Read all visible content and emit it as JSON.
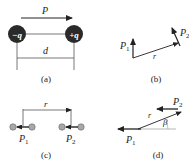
{
  "figure": {
    "panels": [
      {
        "id": "a",
        "caption": "(a)",
        "labels": {
          "moment": "P",
          "distance": "d",
          "neg_charge": "−q",
          "pos_charge": "+q"
        }
      },
      {
        "id": "b",
        "caption": "(b)",
        "labels": {
          "p1": "P",
          "p1_sub": "1",
          "p2": "P",
          "p2_sub": "2",
          "r": "r"
        }
      },
      {
        "id": "c",
        "caption": "(c)",
        "labels": {
          "p1": "P",
          "p1_sub": "1",
          "p2": "P",
          "p2_sub": "2",
          "r": "r"
        }
      },
      {
        "id": "d",
        "caption": "(d)",
        "labels": {
          "p1": "P",
          "p1_sub": "1",
          "p2": "P",
          "p2_sub": "2",
          "r": "r",
          "angle": "β"
        }
      }
    ],
    "colors": {
      "line": "#222222",
      "charge_fill": "#2a2a2a",
      "atom_fill": "#a8a8a8",
      "baseline": "#9a9a9a"
    }
  }
}
